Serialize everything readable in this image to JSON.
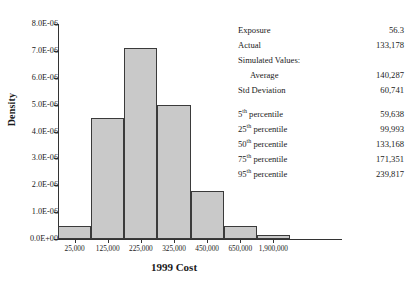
{
  "chart_data": {
    "type": "bar",
    "title": "",
    "xlabel": "1999 Cost",
    "ylabel": "Density",
    "categories": [
      "25,000",
      "125,000",
      "225,000",
      "325,000",
      "450,000",
      "650,000",
      "1,900,000"
    ],
    "values": [
      5e-07,
      4.5e-06,
      7.1e-06,
      5e-06,
      1.8e-06,
      5e-07,
      1.5e-07
    ],
    "ylim": [
      0,
      8e-06
    ],
    "ytick_labels": [
      "0.0E+00",
      "1.0E-06",
      "2.0E-06",
      "3.0E-06",
      "4.0E-06",
      "5.0E-06",
      "6.0E-06",
      "7.0E-06",
      "8.0E-06"
    ],
    "ytick_values": [
      0,
      1e-06,
      2e-06,
      3e-06,
      4e-06,
      5e-06,
      6e-06,
      7e-06,
      8e-06
    ],
    "xtick_labels": [
      "25,000",
      "125,000",
      "225,000",
      "325,000",
      "450,000",
      "650,000",
      "1,900,000"
    ],
    "grid": false,
    "legend": "none",
    "bar_fill_color": "#c9c9c9",
    "bar_edge_color": "#3a3a3a"
  },
  "axes": {
    "y_title": "Density",
    "x_title": "1999 Cost"
  },
  "stats": {
    "rows": [
      {
        "name": "Exposure",
        "value": "56.3",
        "indent": false,
        "sup": ""
      },
      {
        "name": "Actual",
        "value": "133,178",
        "indent": false,
        "sup": ""
      },
      {
        "name": "Simulated Values:",
        "value": "",
        "indent": false,
        "sup": ""
      },
      {
        "name": "Average",
        "value": "140,287",
        "indent": true,
        "sup": ""
      },
      {
        "name": "Std Deviation",
        "value": "60,741",
        "indent": false,
        "sup": ""
      },
      {
        "name": "percentile",
        "value": "59,638",
        "indent": false,
        "sup": "5th"
      },
      {
        "name": "percentile",
        "value": "99,993",
        "indent": false,
        "sup": "25th"
      },
      {
        "name": "percentile",
        "value": "133,168",
        "indent": false,
        "sup": "50th"
      },
      {
        "name": "percentile",
        "value": "171,351",
        "indent": false,
        "sup": "75th"
      },
      {
        "name": "percentile",
        "value": "239,817",
        "indent": false,
        "sup": "95th"
      }
    ]
  }
}
